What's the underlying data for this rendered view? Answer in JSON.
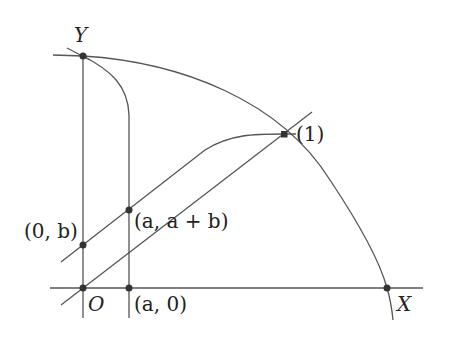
{
  "diagram": {
    "type": "geometric-construction",
    "stroke_color": "#555555",
    "point_color": "#333333",
    "axes": {
      "x_label": "X",
      "y_label": "Y",
      "origin_label": "O"
    },
    "points": [
      {
        "id": "Y-point",
        "label": ""
      },
      {
        "id": "origin",
        "label": "O"
      },
      {
        "id": "a0",
        "label": "(a, 0)"
      },
      {
        "id": "0b",
        "label": "(0, b)"
      },
      {
        "id": "aab",
        "label": "(a, a + b)"
      },
      {
        "id": "one",
        "label": "(1)"
      },
      {
        "id": "X-point",
        "label": ""
      }
    ],
    "labels": {
      "Y": "Y",
      "X": "X",
      "O": "O",
      "a0": "(a, 0)",
      "zero_b": "(0, b)",
      "a_ab": "(a, a + b)",
      "one": "(1)"
    }
  }
}
